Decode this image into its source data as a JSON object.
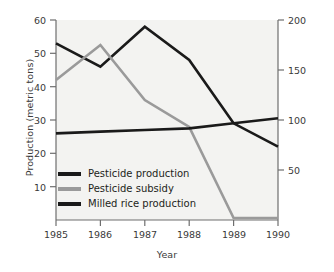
{
  "chart_data": {
    "type": "line",
    "title": "",
    "xlabel": "Year",
    "ylabel": "Production (metric tons)",
    "y2label": "Millions of dollars (U.S. 1995 dollars)",
    "categories": [
      "1985",
      "1986",
      "1987",
      "1988",
      "1989",
      "1990"
    ],
    "x": [
      1985,
      1986,
      1987,
      1988,
      1989,
      1990
    ],
    "xlim": [
      1985,
      1990
    ],
    "ylim": [
      0,
      60
    ],
    "y2lim": [
      0,
      200
    ],
    "yticks": [
      10,
      20,
      30,
      40,
      50,
      60
    ],
    "y2ticks": [
      50,
      100,
      150,
      200
    ],
    "xticks": [
      "1985",
      "1986",
      "1987",
      "1988",
      "1989",
      "1990"
    ],
    "grid": false,
    "legend_position": "lower-left-inside",
    "series": [
      {
        "name": "Pesticide production",
        "axis": "left",
        "color": "#1a1a1a",
        "values": [
          53,
          46,
          58,
          48,
          29,
          22
        ]
      },
      {
        "name": "Pesticide subsidy",
        "axis": "right",
        "color": "#9a9a9a",
        "values": [
          140,
          175,
          120,
          93,
          2,
          2
        ]
      },
      {
        "name": "Milled rice production",
        "axis": "left",
        "color": "#1a1a1a",
        "values": [
          26,
          26.5,
          27,
          27.5,
          29,
          30.5
        ]
      }
    ]
  },
  "axes": {
    "left": {
      "title": "Production (metric tons)",
      "ticks": [
        "60",
        "50",
        "40",
        "30",
        "20",
        "10"
      ]
    },
    "right": {
      "title": "Millions of dollars (U.S. 1995 dollars)",
      "ticks": [
        "200",
        "150",
        "100",
        "50"
      ]
    },
    "bottom": {
      "title": "Year",
      "ticks": [
        "1985",
        "1986",
        "1987",
        "1988",
        "1989",
        "1990"
      ]
    }
  },
  "legend": {
    "items": [
      {
        "label": "Pesticide production",
        "color": "#1a1a1a"
      },
      {
        "label": "Pesticide subsidy",
        "color": "#9a9a9a"
      },
      {
        "label": "Milled rice production",
        "color": "#1a1a1a"
      }
    ]
  },
  "colors": {
    "series_dark": "#1a1a1a",
    "series_gray": "#9a9a9a",
    "axis": "#6e6e6e",
    "text": "#3a3a3a",
    "plot_background": "#f3f3f1"
  }
}
